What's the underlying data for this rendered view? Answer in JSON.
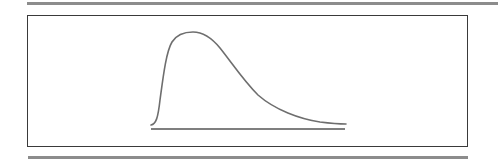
{
  "diagram": {
    "colors": {
      "rule": "#8c8c8c",
      "frame": "#3a3a3a",
      "curve": "#6e6e6e",
      "baseline": "#555555",
      "background": "#ffffff"
    },
    "curve": {
      "shape": "right-skewed",
      "start": [
        151,
        125
      ],
      "peak": [
        193,
        33
      ],
      "end": [
        346,
        124
      ]
    },
    "baseline": {
      "x1": 151,
      "x2": 345,
      "y": 129
    }
  }
}
